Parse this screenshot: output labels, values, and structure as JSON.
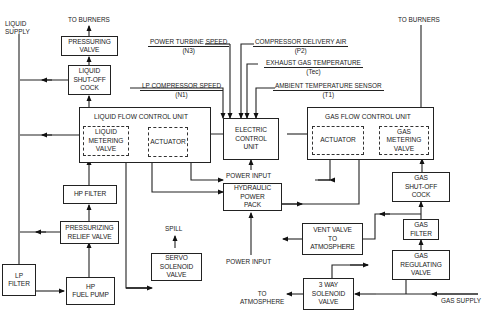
{
  "diagram": {
    "type": "fuel control system block diagram",
    "labels": {
      "liquid_supply": "LIQUID\nSUPPLY",
      "to_burners_left": "TO BURNERS",
      "to_burners_right": "TO BURNERS",
      "spill": "SPILL",
      "power_input_ecu": "POWER INPUT",
      "power_input_hpp": "POWER INPUT",
      "to_atmosphere": "TO\nATMOSPHERE",
      "gas_supply": "GAS SUPPLY"
    },
    "signals": [
      {
        "name": "POWER TURBINE SPEED",
        "code": "(N3)"
      },
      {
        "name": "LP COMPRESSOR SPEED",
        "code": "(N1)"
      },
      {
        "name": "COMPRESSOR DELIVERY AIR",
        "code": "(P2)"
      },
      {
        "name": "EXHAUST GAS TEMPERATURE",
        "code": "(Tec)"
      },
      {
        "name": "AMBIENT TEMPERATURE SENSOR",
        "code": "(T1)"
      }
    ],
    "blocks": {
      "pressuring_valve": "PRESSURING\nVALVE",
      "liquid_shutoff_cock": "LIQUID\nSHUT-OFF\nCOCK",
      "liquid_flow_control_unit": "LIQUID FLOW CONTROL UNIT",
      "liquid_metering_valve": "LIQUID\nMETERING\nVALVE",
      "liquid_actuator": "ACTUATOR",
      "electric_control_unit": "ELECTRIC\nCONTROL\nUNIT",
      "gas_flow_control_unit": "GAS FLOW CONTROL UNIT",
      "gas_actuator": "ACTUATOR",
      "gas_metering_valve": "GAS\nMETERING\nVALVE",
      "hp_filter": "HP FILTER",
      "pressurizing_relief_valve": "PRESSURIZING\nRELIEF VALVE",
      "lp_filter": "LP\nFILTER",
      "hp_fuel_pump": "HP\nFUEL PUMP",
      "servo_solenoid_valve": "SERVO\nSOLENOID\nVALVE",
      "hydraulic_power_pack": "HYDRAULIC\nPOWER\nPACK",
      "gas_shutoff_cock": "GAS\nSHUT-OFF\nCOCK",
      "gas_filter": "GAS\nFILTER",
      "vent_valve": "VENT VALVE\nTO\nATMOSPHERE",
      "gas_regulating_valve": "GAS\nREGULATING\nVALVE",
      "three_way_solenoid_valve": "3 WAY\nSOLENOID\nVALVE"
    }
  }
}
